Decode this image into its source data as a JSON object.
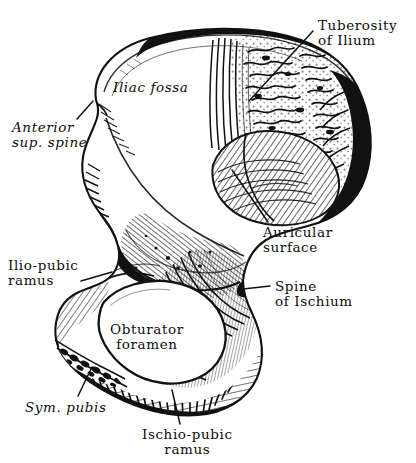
{
  "figure": {
    "kind": "anatomical-line-engraving",
    "background_color": "#ffffff",
    "ink_color": "#0d0d0d",
    "width": 416,
    "height": 463
  },
  "labels": [
    {
      "id": "tuberosity-of-ilium",
      "lines": [
        "Tuberosity",
        "of Ilium"
      ],
      "align": "left",
      "x": 318,
      "y": 18,
      "italic": false,
      "leader": {
        "x1": 313,
        "y1": 31,
        "x2": 249,
        "y2": 101
      }
    },
    {
      "id": "anterior-sup-spine",
      "lines": [
        "Anterior",
        "sup. spine"
      ],
      "align": "left",
      "x": 12,
      "y": 120,
      "italic": true,
      "leader": {
        "x1": 77,
        "y1": 119,
        "x2": 93,
        "y2": 101
      }
    },
    {
      "id": "iliac-fossa",
      "lines": [
        "Iliac fossa"
      ],
      "align": "left",
      "x": 113,
      "y": 80,
      "italic": true,
      "leader": null
    },
    {
      "id": "auricular-surface",
      "lines": [
        "Auricular",
        "surface"
      ],
      "align": "left",
      "x": 263,
      "y": 225,
      "italic": false,
      "leader": {
        "x1": 268,
        "y1": 222,
        "x2": 232,
        "y2": 170
      }
    },
    {
      "id": "ilio-pubic-ramus",
      "lines": [
        "Ilio-pubic",
        "ramus"
      ],
      "align": "left",
      "x": 8,
      "y": 258,
      "italic": false,
      "leader": {
        "x1": 81,
        "y1": 281,
        "x2": 112,
        "y2": 272
      }
    },
    {
      "id": "spine-of-ischium",
      "lines": [
        "Spine",
        "of Ischium"
      ],
      "align": "left",
      "x": 275,
      "y": 279,
      "italic": false,
      "leader": {
        "x1": 270,
        "y1": 286,
        "x2": 243,
        "y2": 289
      }
    },
    {
      "id": "obturator-foramen",
      "lines": [
        "Obturator",
        "foramen"
      ],
      "align": "center",
      "x": 110,
      "y": 322,
      "italic": false,
      "leader": null
    },
    {
      "id": "sym-pubis",
      "lines": [
        "Sym. pubis"
      ],
      "align": "left",
      "x": 25,
      "y": 400,
      "italic": true,
      "leader": {
        "x1": 78,
        "y1": 396,
        "x2": 92,
        "y2": 367
      }
    },
    {
      "id": "ischio-pubic-ramus",
      "lines": [
        "Ischio-pubic",
        "ramus"
      ],
      "align": "center",
      "x": 142,
      "y": 427,
      "italic": false,
      "leader": {
        "x1": 180,
        "y1": 424,
        "x2": 172,
        "y2": 390
      }
    }
  ]
}
